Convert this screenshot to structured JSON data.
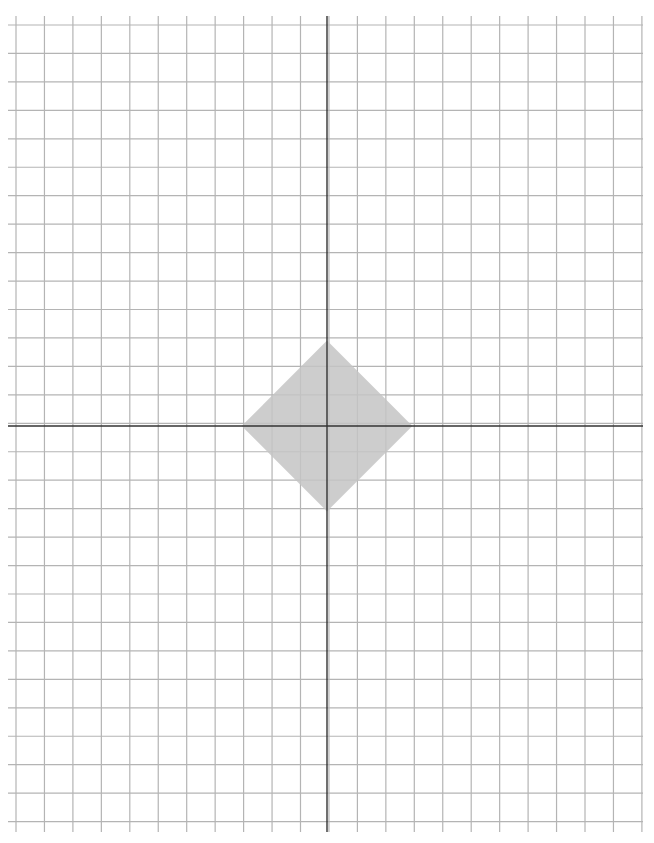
{
  "diagram": {
    "type": "coordinate-grid",
    "grid": {
      "columns": 22,
      "rows": 28,
      "unit_px": 28.45,
      "origin_px": [
        327,
        426
      ],
      "left_px": 16,
      "top_px": 25,
      "line_color": "#b4b4b4",
      "axis_color": "#333333"
    },
    "shape": {
      "name": "diamond",
      "vertices": [
        [
          0,
          3
        ],
        [
          3,
          0
        ],
        [
          0,
          -3
        ],
        [
          -3,
          0
        ]
      ],
      "fill": "#c4c4c4"
    }
  }
}
